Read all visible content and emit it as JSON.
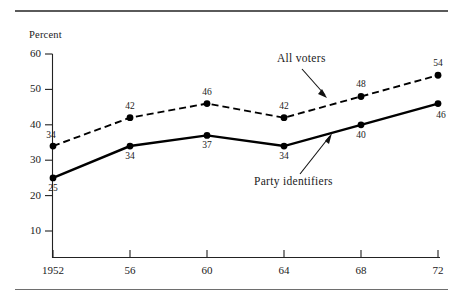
{
  "figure": {
    "axis_title": "Percent",
    "top_rule": true,
    "bottom_rule": true
  },
  "chart_data": {
    "type": "line",
    "title": "",
    "xlabel": "",
    "ylabel": "Percent",
    "x": [
      1952,
      1956,
      1960,
      1964,
      1968,
      1972
    ],
    "categories": [
      "1952",
      "56",
      "60",
      "64",
      "68",
      "72"
    ],
    "xtick_labels": [
      "1952",
      "56",
      "60",
      "64",
      "68",
      "72"
    ],
    "ytick_labels": [
      "10",
      "20",
      "30",
      "40",
      "50",
      "60"
    ],
    "yticks": [
      10,
      20,
      30,
      40,
      50,
      60
    ],
    "ylim": [
      5,
      62
    ],
    "xlim": [
      1951,
      1973
    ],
    "grid": false,
    "legend": "annotations",
    "series": [
      {
        "name": "All voters",
        "style": "dashed",
        "color": "#000000",
        "marker": "filled-circle",
        "values": [
          34,
          42,
          46,
          42,
          48,
          54
        ],
        "value_labels": [
          "34",
          "42",
          "46",
          "42",
          "48",
          "54"
        ],
        "label_positions": [
          "above-left",
          "above",
          "above",
          "above",
          "above",
          "above"
        ]
      },
      {
        "name": "Party identifiers",
        "style": "solid",
        "color": "#000000",
        "marker": "filled-circle",
        "values": [
          25,
          34,
          37,
          34,
          40,
          46
        ],
        "value_labels": [
          "25",
          "34",
          "37",
          "34",
          "40",
          "46"
        ],
        "label_positions": [
          "below",
          "below",
          "below",
          "below",
          "below",
          "below-right"
        ]
      }
    ],
    "annotations": [
      {
        "text": "All voters",
        "target_series": "All voters",
        "arrow": true
      },
      {
        "text": "Party identifiers",
        "target_series": "Party identifiers",
        "arrow": true
      }
    ]
  }
}
